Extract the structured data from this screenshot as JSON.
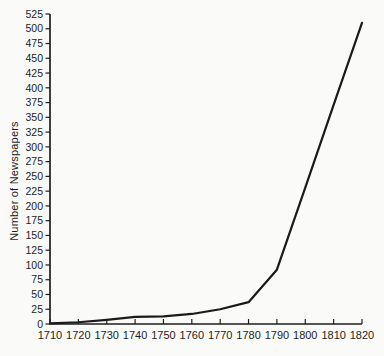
{
  "page": {
    "background_color": "#fafaf8"
  },
  "chart_data": {
    "type": "line",
    "title": "",
    "xlabel": "",
    "ylabel": "Number of Newspapers",
    "x": [
      1710,
      1720,
      1730,
      1740,
      1750,
      1760,
      1770,
      1780,
      1790,
      1800,
      1810,
      1820
    ],
    "values": [
      1,
      3,
      7,
      12,
      13,
      17,
      25,
      37,
      92,
      231,
      371,
      510
    ],
    "x_ticks": [
      1710,
      1720,
      1730,
      1740,
      1750,
      1760,
      1770,
      1780,
      1790,
      1800,
      1810,
      1820
    ],
    "y_ticks": [
      0,
      25,
      50,
      75,
      100,
      125,
      150,
      175,
      200,
      225,
      250,
      275,
      300,
      325,
      350,
      375,
      400,
      425,
      450,
      475,
      500,
      525
    ],
    "xlim": [
      1710,
      1820
    ],
    "ylim": [
      0,
      525
    ],
    "grid": false,
    "legend": null,
    "line_color": "#1a1a1a",
    "axis_color": "#1f1f1f",
    "label_color": "#1d1d1d"
  }
}
